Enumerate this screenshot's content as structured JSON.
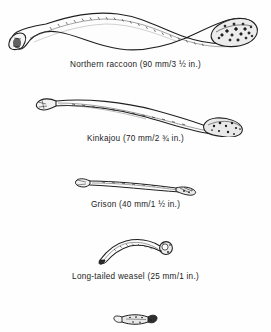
{
  "figure": {
    "type": "scientific-illustration-plate",
    "background_color": "#fefefe",
    "ink_color": "#1b1b1b",
    "specimens": [
      {
        "id": "northern-raccoon",
        "common_name": "Northern raccoon",
        "length_mm": 90,
        "length_inches": "3 ½",
        "caption": "Northern raccoon (90 mm/3 ½ in.)",
        "shape": "long s-curved shaft, hooked flared proximal tip at left, thickened stippled distal knob at right"
      },
      {
        "id": "kinkajou",
        "common_name": "Kinkajou",
        "length_mm": 70,
        "length_inches": "2 ¾",
        "caption": "Kinkajou (70 mm/2 ¾ in.)",
        "shape": "gently arched slender shaft, forked flange at left tip, irregular knobby head at right"
      },
      {
        "id": "grison",
        "common_name": "Grison",
        "length_mm": 40,
        "length_inches": "1 ½",
        "caption": "Grison (40 mm/1 ½ in.)",
        "shape": "slim nearly straight rod, small splayed left tip, notched hooked right terminus"
      },
      {
        "id": "long-tailed-weasel",
        "common_name": "Long-tailed weasel",
        "length_mm": 25,
        "length_inches": "1",
        "caption": "Long-tailed weasel (25 mm/1 in.)",
        "shape": "sharply curved shaft sweeping up to a bulbous rounded knob at right"
      },
      {
        "id": "unlabeled-small-specimen",
        "common_name": "",
        "caption": "",
        "shape": "very small stout baculum, caption cropped off below page edge"
      }
    ]
  }
}
